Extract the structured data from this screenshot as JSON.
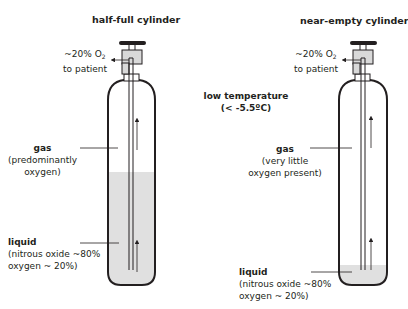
{
  "diagram": {
    "type": "comparison",
    "colors": {
      "outline": "#231f20",
      "liquid": "#e0e0e0",
      "background": "#ffffff"
    },
    "center_note": {
      "line1": "low temperature",
      "line2": "(< -5.5ºC)"
    },
    "cylinders": [
      {
        "title": "half-full cylinder",
        "outlet": {
          "line1_prefix": "~20% O",
          "line1_sub": "2",
          "line2": "to patient"
        },
        "gas": {
          "label": "gas",
          "desc1": "(predominantly",
          "desc2": "oxygen)"
        },
        "liquid": {
          "label": "liquid",
          "desc1": "(nitrous oxide ~80%",
          "desc2": "oxygen ~ 20%)"
        },
        "fill_level": "half"
      },
      {
        "title": "near-empty cylinder",
        "outlet": {
          "line1_prefix": "~20% O",
          "line1_sub": "2",
          "line2": "to patient"
        },
        "gas": {
          "label": "gas",
          "desc1": "(very little",
          "desc2": "oxygen present)"
        },
        "liquid": {
          "label": "liquid",
          "desc1": "(nitrous oxide ~80%",
          "desc2": "oxygen ~ 20%)"
        },
        "fill_level": "low"
      }
    ]
  }
}
